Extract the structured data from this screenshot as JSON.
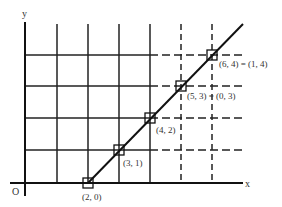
{
  "diagram": {
    "axes": {
      "x_label": "x",
      "y_label": "y",
      "origin_label": "O"
    },
    "points": [
      {
        "label": "(2, 0)"
      },
      {
        "label": "(3, 1)"
      },
      {
        "label": "(4, 2)"
      },
      {
        "label": "(5, 3) = (0, 3)"
      },
      {
        "label": "(6, 4) = (1, 4)"
      }
    ],
    "colors": {
      "line": "#111111",
      "grid": "#222222",
      "text": "#333333"
    }
  }
}
